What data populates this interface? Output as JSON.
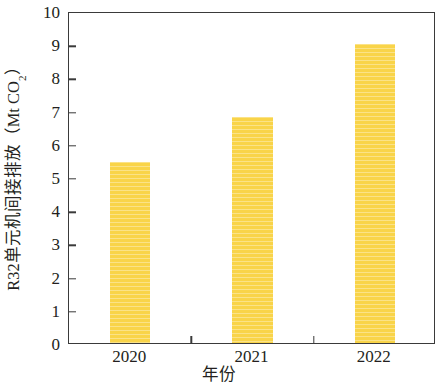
{
  "chart_data": {
    "type": "bar",
    "title": "",
    "categories": [
      "2020",
      "2021",
      "2022"
    ],
    "values": [
      5.45,
      6.8,
      9.0
    ],
    "series": [
      {
        "name": "R32单元机间接排放",
        "values": [
          5.45,
          6.8,
          9.0
        ]
      }
    ],
    "xlabel": "年份",
    "ylabel": "R32单元机间接排放（Mt CO₂）",
    "ylabel_main": "R32单元机间接排放（Mt CO",
    "ylabel_sub": "2",
    "ylabel_tail": "）",
    "ylim": [
      0,
      10
    ],
    "yticks": [
      0,
      1,
      2,
      3,
      4,
      5,
      6,
      7,
      8,
      9,
      10
    ],
    "ytick_labels": [
      "0",
      "1",
      "2",
      "3",
      "4",
      "5",
      "6",
      "7",
      "8",
      "9",
      "10"
    ],
    "grid": false,
    "legend": false,
    "legend_position": "none",
    "bar_color": "#f9d449",
    "axis_color": "#3a3a3a",
    "text_color": "#231f20",
    "bar_width_fraction": 0.33
  }
}
